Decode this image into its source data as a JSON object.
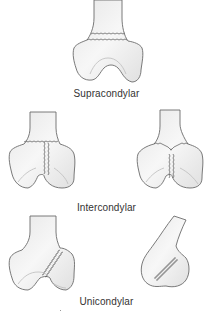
{
  "diagram": {
    "colors": {
      "outline": "#6b6b6b",
      "bone_fill": "#f2f2f2",
      "shade": "#d8d8d8",
      "text": "#333333"
    },
    "sections": [
      {
        "id": "supracondylar",
        "label": "Supracondylar",
        "figures": [
          "anterior view: transverse fracture line above condyles"
        ]
      },
      {
        "id": "intercondylar",
        "label": "Intercondylar",
        "figures": [
          "anterior view: T-shaped fracture",
          "anterior view: Y-shaped fracture"
        ]
      },
      {
        "id": "unicondylar",
        "label": "Unicondylar",
        "figures": [
          "anterior view: oblique fracture of one condyle",
          "lateral view: coronal plane condyle fracture"
        ]
      }
    ]
  }
}
